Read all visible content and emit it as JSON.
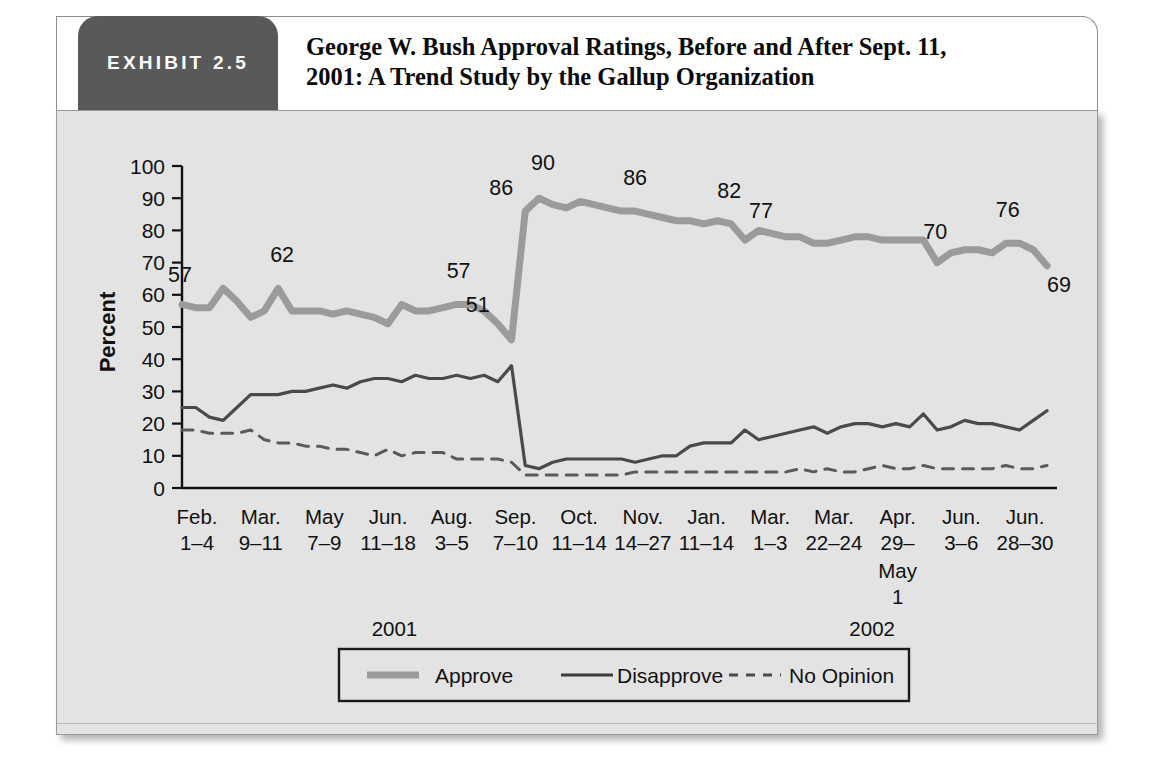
{
  "exhibit": {
    "badge_label": "EXHIBIT 2.5",
    "title": "George W. Bush Approval Ratings, Before and After Sept. 11, 2001: A Trend Study by the Gallup Organization",
    "title_line1": "George W. Bush Approval Ratings, Before and After Sept. 11,",
    "title_line2": "2001: A Trend Study by the Gallup Organization",
    "badge_color": "#595959",
    "panel_color": "#e3e3e3"
  },
  "chart_data": {
    "type": "line",
    "title": "George W. Bush Approval Ratings, Before and After Sept. 11, 2001: A Trend Study by the Gallup Organization",
    "xlabel": "",
    "ylabel": "Percent",
    "ylim": [
      0,
      100
    ],
    "ytick_step": 10,
    "yticks": [
      0,
      10,
      20,
      30,
      40,
      50,
      60,
      70,
      80,
      90,
      100
    ],
    "grid": false,
    "legend_position": "bottom",
    "axis_tick_labels": [
      {
        "month": "Feb.",
        "days": "1–4"
      },
      {
        "month": "Mar.",
        "days": "9–11"
      },
      {
        "month": "May",
        "days": "7–9"
      },
      {
        "month": "Jun.",
        "days": "11–18"
      },
      {
        "month": "Aug.",
        "days": "3–5"
      },
      {
        "month": "Sep.",
        "days": "7–10"
      },
      {
        "month": "Oct.",
        "days": "11–14"
      },
      {
        "month": "Nov.",
        "days": "14–27"
      },
      {
        "month": "Jan.",
        "days": "11–14"
      },
      {
        "month": "Mar.",
        "days": "1–3"
      },
      {
        "month": "Mar.",
        "days": "22–24"
      },
      {
        "month": "Apr.",
        "days": "29–",
        "days_line2": "May",
        "days_line3": "1"
      },
      {
        "month": "Jun.",
        "days": "3–6"
      },
      {
        "month": "Jun.",
        "days": "28–30"
      }
    ],
    "year_labels": [
      {
        "text": "2001",
        "at_tick": 3.1
      },
      {
        "text": "2002",
        "at_tick": 10.6
      }
    ],
    "series": [
      {
        "name": "Approve",
        "style": "thick-solid",
        "color": "#9b9b9b",
        "values": [
          57,
          56,
          56,
          62,
          58,
          53,
          55,
          62,
          55,
          55,
          55,
          54,
          55,
          54,
          53,
          51,
          57,
          55,
          55,
          56,
          57,
          57,
          55,
          51,
          46,
          86,
          90,
          88,
          87,
          89,
          88,
          87,
          86,
          86,
          85,
          84,
          83,
          83,
          82,
          83,
          82,
          77,
          80,
          79,
          78,
          78,
          76,
          76,
          77,
          78,
          78,
          77,
          77,
          77,
          77,
          70,
          73,
          74,
          74,
          73,
          76,
          76,
          74,
          69
        ]
      },
      {
        "name": "Disapprove",
        "style": "thin-solid",
        "color": "#4a4a4a",
        "values": [
          25,
          25,
          22,
          21,
          25,
          29,
          29,
          29,
          30,
          30,
          31,
          32,
          31,
          33,
          34,
          34,
          33,
          35,
          34,
          34,
          35,
          34,
          35,
          33,
          38,
          7,
          6,
          8,
          9,
          9,
          9,
          9,
          9,
          8,
          9,
          10,
          10,
          13,
          14,
          14,
          14,
          18,
          15,
          16,
          17,
          18,
          19,
          17,
          19,
          20,
          20,
          19,
          20,
          19,
          23,
          18,
          19,
          21,
          20,
          20,
          19,
          18,
          21,
          24
        ]
      },
      {
        "name": "No Opinion",
        "style": "dashed",
        "color": "#5a5a5a",
        "values": [
          18,
          18,
          17,
          17,
          17,
          18,
          15,
          14,
          14,
          13,
          13,
          12,
          12,
          11,
          10,
          12,
          10,
          11,
          11,
          11,
          9,
          9,
          9,
          9,
          8,
          4,
          4,
          4,
          4,
          4,
          4,
          4,
          4,
          5,
          5,
          5,
          5,
          5,
          5,
          5,
          5,
          5,
          5,
          5,
          5,
          6,
          5,
          6,
          5,
          5,
          6,
          7,
          6,
          6,
          7,
          6,
          6,
          6,
          6,
          6,
          7,
          6,
          6,
          7
        ]
      }
    ],
    "point_labels": [
      {
        "text": "57",
        "series": "Approve",
        "index": 0
      },
      {
        "text": "62",
        "series": "Approve",
        "index": 7
      },
      {
        "text": "57",
        "series": "Approve",
        "index": 20
      },
      {
        "text": "51",
        "series": "Approve",
        "index": 23
      },
      {
        "text": "86",
        "series": "Approve",
        "index": 25
      },
      {
        "text": "90",
        "series": "Approve",
        "index": 26
      },
      {
        "text": "86",
        "series": "Approve",
        "index": 33
      },
      {
        "text": "82",
        "series": "Approve",
        "index": 40
      },
      {
        "text": "77",
        "series": "Approve",
        "index": 41
      },
      {
        "text": "70",
        "series": "Approve",
        "index": 55
      },
      {
        "text": "76",
        "series": "Approve",
        "index": 60
      },
      {
        "text": "69",
        "series": "Approve",
        "index": 63
      }
    ]
  },
  "legend": {
    "items": [
      {
        "label": "Approve",
        "style": "thick-solid",
        "color": "#9b9b9b"
      },
      {
        "label": "Disapprove",
        "style": "thin-solid",
        "color": "#3d3d3d"
      },
      {
        "label": "No Opinion",
        "style": "dashed",
        "color": "#4a4a4a"
      }
    ]
  }
}
